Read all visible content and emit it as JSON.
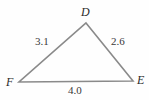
{
  "figure": {
    "type": "triangle-diagram",
    "background_color": "#fefefe",
    "line_color": "#8a8a8a",
    "line_width": 1.6,
    "vertices": [
      {
        "id": "D",
        "label": "D",
        "x": 86,
        "y": 23
      },
      {
        "id": "F",
        "label": "F",
        "x": 19,
        "y": 82
      },
      {
        "id": "E",
        "label": "E",
        "x": 133,
        "y": 81
      }
    ],
    "sides": [
      {
        "id": "DF",
        "label": "3.1",
        "from": "D",
        "to": "F",
        "label_x": 35,
        "label_y": 36
      },
      {
        "id": "DE",
        "label": "2.6",
        "from": "D",
        "to": "E",
        "label_x": 111,
        "label_y": 36
      },
      {
        "id": "FE",
        "label": "4.0",
        "from": "F",
        "to": "E",
        "label_x": 68,
        "label_y": 85
      }
    ],
    "vertex_label_color": "#2b2b2b",
    "side_label_color": "#3a3a3a"
  },
  "chart_data": {
    "type": "diagram",
    "title": "",
    "categories": [
      "DF",
      "DE",
      "FE"
    ],
    "values": [
      3.1,
      2.6,
      4.0
    ],
    "labels": [
      "3.1",
      "2.6",
      "4.0"
    ],
    "vertex_names": [
      "D",
      "E",
      "F"
    ],
    "xlabel": "",
    "ylabel": ""
  }
}
